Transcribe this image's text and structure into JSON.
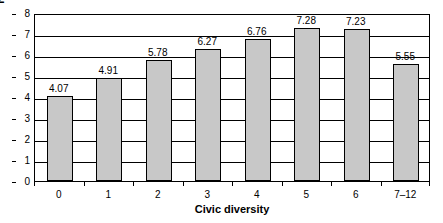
{
  "chart_data": {
    "type": "bar",
    "title": "",
    "xlabel": "Civic diversity",
    "ylabel": "Network diversity",
    "categories": [
      "0",
      "1",
      "2",
      "3",
      "4",
      "5",
      "6",
      "7–12"
    ],
    "values": [
      4.07,
      4.91,
      5.78,
      6.27,
      6.76,
      7.28,
      7.23,
      5.55
    ],
    "value_labels": [
      "4.07",
      "4.91",
      "5.78",
      "6.27",
      "6.76",
      "7.28",
      "7.23",
      "5.55"
    ],
    "ylim": [
      0,
      8
    ],
    "y_ticks": [
      0,
      1,
      2,
      3,
      4,
      5,
      6,
      7,
      8
    ],
    "y_tick_labels": [
      "0",
      "1",
      "2",
      "3",
      "4",
      "5",
      "6",
      "7",
      "8"
    ],
    "grid": true,
    "grid_axis": "y",
    "legend": false,
    "legend_position": "none",
    "bar_fill_color": "#c8c8c8",
    "bar_border_color": "#000000",
    "plot_background": "#ffffff",
    "axis_color": "#000000"
  }
}
